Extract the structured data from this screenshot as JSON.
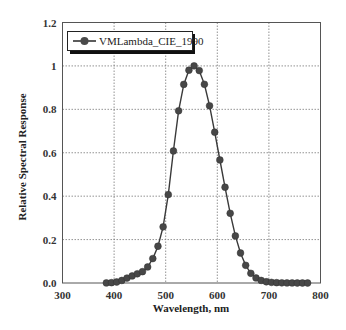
{
  "chart_data": {
    "type": "line",
    "title": "",
    "xlabel": "Wavelength, nm",
    "ylabel": "Relative Spectral Response",
    "xlim": [
      300,
      800
    ],
    "ylim": [
      0,
      1.2
    ],
    "xticks": [
      300,
      400,
      500,
      600,
      700,
      800
    ],
    "xtick_labels": [
      "300",
      "400",
      "500",
      "600",
      "700",
      "800"
    ],
    "yticks": [
      0,
      0.2,
      0.4,
      0.6,
      0.8,
      1.0,
      1.2
    ],
    "ytick_labels": [
      "0.0",
      "0.2",
      "0.4",
      "0.6",
      "0.8",
      "1",
      "1.2"
    ],
    "grid": true,
    "legend_position": "upper left",
    "series": [
      {
        "name": "VMLambda_CIE_1990",
        "color": "#3a3a3a",
        "marker": "circle",
        "x": [
          385,
          395,
          405,
          415,
          425,
          435,
          445,
          455,
          465,
          475,
          485,
          495,
          505,
          515,
          525,
          535,
          545,
          555,
          565,
          575,
          585,
          595,
          605,
          615,
          625,
          635,
          645,
          655,
          665,
          675,
          685,
          695,
          705,
          715,
          725,
          735,
          745,
          755,
          765,
          775
        ],
        "y": [
          0.0004,
          0.0015,
          0.0047,
          0.0118,
          0.0227,
          0.0326,
          0.0424,
          0.0521,
          0.0739,
          0.1126,
          0.1693,
          0.2586,
          0.4073,
          0.6082,
          0.7932,
          0.9149,
          0.9803,
          1.0002,
          0.9786,
          0.9154,
          0.8163,
          0.6949,
          0.5668,
          0.4412,
          0.321,
          0.217,
          0.1382,
          0.0816,
          0.0446,
          0.0232,
          0.0119,
          0.0057,
          0.0029,
          0.0015,
          0.0007,
          0.0004,
          0.0002,
          0.0001,
          0.0,
          0.0
        ]
      }
    ]
  },
  "legend": {
    "label": "VMLambda_CIE_1990"
  },
  "axes": {
    "xlabel": "Wavelength, nm",
    "ylabel": "Relative Spectral Response"
  }
}
